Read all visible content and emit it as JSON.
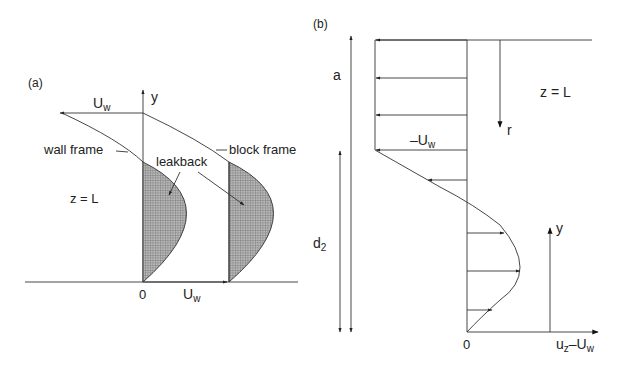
{
  "panel_a": {
    "label": "(a)",
    "y_axis": "y",
    "top_velocity": "U",
    "top_velocity_sub": "w",
    "bottom_velocity": "U",
    "bottom_velocity_sub": "w",
    "origin": "0",
    "wall_frame": "wall frame",
    "block_frame": "block frame",
    "leakback": "leakback",
    "position": "z = L"
  },
  "panel_b": {
    "label": "(b)",
    "dim_a": "a",
    "dim_d2": "d",
    "dim_d2_sub": "2",
    "neg_velocity": "–U",
    "neg_velocity_sub": "w",
    "r_axis": "r",
    "position": "z = L",
    "y_axis": "y",
    "origin": "0",
    "x_axis_u": "u",
    "x_axis_u_sub": "z",
    "x_axis_minus": "–U",
    "x_axis_minus_sub": "w"
  },
  "colors": {
    "line": "#333333",
    "hatch": "#8a8a8a",
    "background": "#ffffff"
  }
}
